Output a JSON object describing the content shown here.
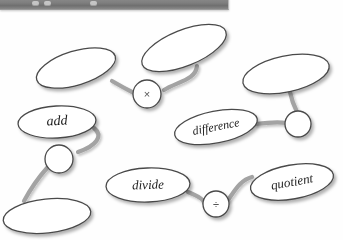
{
  "toolbar": {
    "name": "application-toolbar",
    "visible": true,
    "clipped": true,
    "background_color": "#7e7e7e",
    "buttons": [
      "toolbar-button-1",
      "toolbar-button-2",
      "toolbar-button-3"
    ],
    "title": ""
  },
  "canvas": {
    "background_color": "#fefefe",
    "stroke_color": "#4a4a4a",
    "connector_color": "#9c9c9c",
    "shadow_color": "#b5b5b5",
    "node_fill": "#ffffff"
  },
  "nodes": [
    {
      "id": "node-ellipse-top-left",
      "kind": "ellipse",
      "label": "",
      "cx": 76,
      "cy": 68,
      "rx": 41,
      "ry": 17,
      "rotation": -17
    },
    {
      "id": "node-ellipse-top-middle",
      "cx": 184,
      "cy": 48,
      "rx": 45,
      "ry": 18,
      "rotation": -22,
      "kind": "ellipse",
      "label": ""
    },
    {
      "id": "node-ellipse-top-right",
      "kind": "ellipse",
      "label": "",
      "cx": 286,
      "cy": 74,
      "rx": 44,
      "ry": 18,
      "rotation": -12
    },
    {
      "id": "node-ellipse-add",
      "kind": "ellipse",
      "label": "add",
      "cx": 57,
      "cy": 122,
      "rx": 39,
      "ry": 16,
      "rotation": -3,
      "font_size": 14
    },
    {
      "id": "node-ellipse-difference",
      "kind": "ellipse",
      "label": "difference",
      "cx": 216,
      "cy": 127,
      "rx": 42,
      "ry": 16,
      "rotation": -11,
      "font_size": 12
    },
    {
      "id": "node-ellipse-divide",
      "kind": "ellipse",
      "label": "divide",
      "cx": 148,
      "cy": 185,
      "rx": 42,
      "ry": 17,
      "rotation": -2,
      "font_size": 13
    },
    {
      "id": "node-ellipse-quotient",
      "kind": "ellipse",
      "label": "quotient",
      "cx": 292,
      "cy": 182,
      "rx": 42,
      "ry": 17,
      "rotation": -10,
      "font_size": 13
    },
    {
      "id": "node-ellipse-bottom-left",
      "kind": "ellipse",
      "label": "",
      "cx": 47,
      "cy": 216,
      "rx": 44,
      "ry": 17,
      "rotation": -6
    },
    {
      "id": "node-circle-multiply",
      "kind": "circle",
      "label": "×",
      "cx": 147,
      "cy": 94,
      "r": 14,
      "font_size": 11
    },
    {
      "id": "node-circle-divide",
      "kind": "circle",
      "label": "÷",
      "cx": 216,
      "cy": 204,
      "r": 13,
      "font_size": 10
    },
    {
      "id": "node-circle-empty-left",
      "kind": "circle",
      "label": "",
      "cx": 59,
      "cy": 159,
      "r": 14
    },
    {
      "id": "node-circle-empty-right",
      "kind": "circle",
      "label": "",
      "cx": 298,
      "cy": 124,
      "r": 13
    }
  ],
  "connectors": [
    {
      "id": "connector-topleft-to-multiply",
      "from": "node-ellipse-top-left",
      "to": "node-circle-multiply"
    },
    {
      "id": "connector-topmiddle-to-multiply",
      "from": "node-ellipse-top-middle",
      "to": "node-circle-multiply"
    },
    {
      "id": "connector-topright-to-circle-right",
      "from": "node-ellipse-top-right",
      "to": "node-circle-empty-right"
    },
    {
      "id": "connector-difference-to-circle-right",
      "from": "node-ellipse-difference",
      "to": "node-circle-empty-right"
    },
    {
      "id": "connector-add-to-circle-left",
      "from": "node-ellipse-add",
      "to": "node-circle-empty-left"
    },
    {
      "id": "connector-circle-left-to-bottomleft",
      "from": "node-circle-empty-left",
      "to": "node-ellipse-bottom-left"
    },
    {
      "id": "connector-divide-to-divide-op",
      "from": "node-ellipse-divide",
      "to": "node-circle-divide"
    },
    {
      "id": "connector-divide-op-to-quotient",
      "from": "node-circle-divide",
      "to": "node-ellipse-quotient"
    }
  ]
}
